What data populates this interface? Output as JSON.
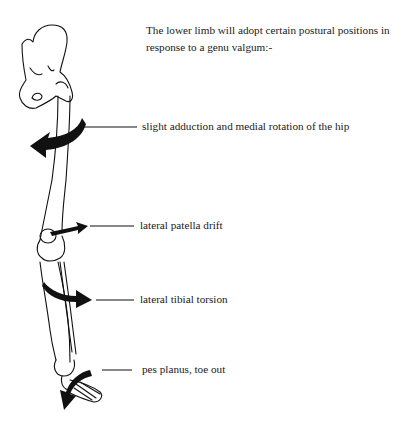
{
  "intro_text": "The lower limb will adopt certain postural positions in response to a genu valgum:-",
  "labels": [
    {
      "text": "slight adduction and medial rotation of the hip"
    },
    {
      "text": "lateral patella drift"
    },
    {
      "text": "lateral tibial torsion"
    },
    {
      "text": "pes planus, toe out"
    }
  ]
}
